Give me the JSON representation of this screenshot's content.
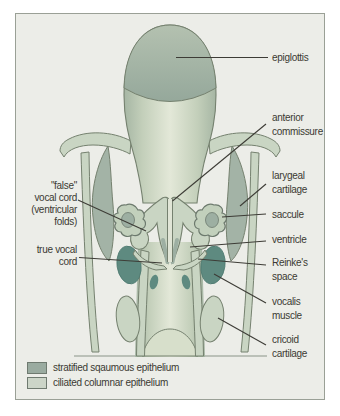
{
  "labels": {
    "epiglottis": "epiglottis",
    "anterior_commissure": "anterior\ncommissure",
    "laryngeal_cartilage": "larygeal\ncartilage",
    "saccule": "saccule",
    "ventricle": "ventricle",
    "reinkes_space": "Reinke's\nspace",
    "vocalis_muscle": "vocalis\nmuscle",
    "cricoid_cartilage": "cricoid\ncartilage",
    "false_vocal_cord": "\"false\"\nvocal cord\n(ventricular\nfolds)",
    "true_vocal_cord": "true vocal\ncord"
  },
  "legend": {
    "items": [
      {
        "label": "stratified sqaumous epithelium",
        "color": "#9aaba0"
      },
      {
        "label": "ciliated columnar epithelium",
        "color": "#ccd5c8"
      }
    ]
  },
  "colors": {
    "panel_background": "#ecede8",
    "light_epithelium": "#c9d5c3",
    "medium_epithelium": "#9dafa2",
    "muscle_dark_teal": "#5e8a80",
    "outline": "#75816f",
    "leader_line": "#3d3c36",
    "text": "#3b3a33"
  }
}
